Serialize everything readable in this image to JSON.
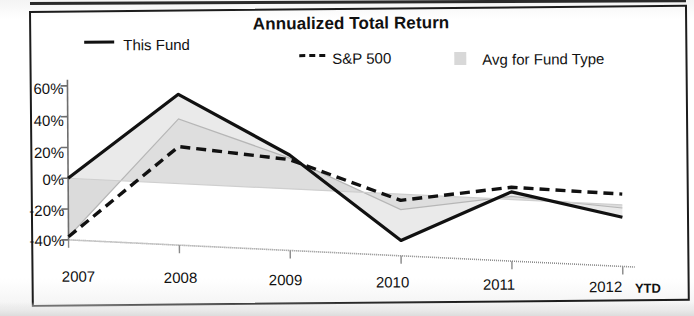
{
  "chart_data": {
    "type": "line",
    "title": "Annualized Total Return",
    "xlabel": "",
    "ylabel": "",
    "categories": [
      "2007",
      "2008",
      "2009",
      "2010",
      "2011",
      "2012"
    ],
    "x_tick_labels": [
      "2007",
      "2008",
      "2009",
      "2010",
      "2011",
      "2012"
    ],
    "x_axis_suffix": "YTD",
    "y_tick_labels": [
      "60%",
      "40%",
      "20%",
      "0%",
      "-20%",
      "-40%"
    ],
    "y_tick_values": [
      60,
      40,
      20,
      0,
      -20,
      -40
    ],
    "ylim": [
      -40,
      60
    ],
    "grid": false,
    "legend_position": "top",
    "series": [
      {
        "name": "This Fund",
        "style": "solid",
        "color": "#111111",
        "values": [
          0,
          58,
          22,
          -30,
          5,
          -8
        ]
      },
      {
        "name": "S&P 500",
        "style": "dashed",
        "color": "#111111",
        "values": [
          -38,
          24,
          19,
          -4,
          8,
          7
        ]
      },
      {
        "name": "Avg for Fund Type",
        "style": "area",
        "color": "#d8d8d8",
        "values": [
          -38,
          42,
          20,
          -10,
          2,
          -2
        ]
      }
    ]
  },
  "chart": {
    "title": "Annualized Total Return",
    "legend": [
      {
        "label": "This Fund",
        "marker": "solid-line-swatch"
      },
      {
        "label": "S&P 500",
        "marker": "dashed-line-swatch",
        "prefix": "---"
      },
      {
        "label": "Avg for Fund Type",
        "marker": "gray-box-swatch"
      }
    ],
    "y_axis": {
      "labels": [
        "60%",
        "40%",
        "20%",
        "0%",
        "-20%",
        "-40%"
      ]
    },
    "x_axis": {
      "labels": [
        "2007",
        "2008",
        "2009",
        "2010",
        "2011",
        "2012"
      ],
      "ytd_label": "YTD"
    }
  }
}
